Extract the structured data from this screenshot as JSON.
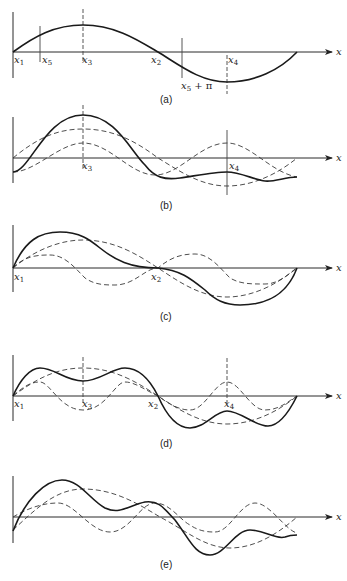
{
  "figure": {
    "axis_label": "x",
    "panels": [
      {
        "id": "a",
        "caption": "(a)",
        "markers": [
          "x1",
          "x5",
          "x3",
          "x2",
          "x5 + π",
          "x4"
        ],
        "description": "single sine wave over one period with marked points"
      },
      {
        "id": "b",
        "caption": "(b)",
        "markers": [
          "x3",
          "x4"
        ],
        "description": "solid composite curve with two dashed component waves, shifted phase"
      },
      {
        "id": "c",
        "caption": "(c)",
        "markers": [
          "x1",
          "x2"
        ],
        "description": "solid composite curve (odd about x2) with two dashed components"
      },
      {
        "id": "d",
        "caption": "(d)",
        "markers": [
          "x1",
          "x3",
          "x2",
          "x4"
        ],
        "description": "solid composite with fundamental and third-harmonic dashed components"
      },
      {
        "id": "e",
        "caption": "(e)",
        "markers": [],
        "description": "solid composite with two dashed components, general phase"
      }
    ],
    "labels": {
      "x1": "x",
      "x1_sub": "1",
      "x2": "x",
      "x2_sub": "2",
      "x3": "x",
      "x3_sub": "3",
      "x4": "x",
      "x4_sub": "4",
      "x5": "x",
      "x5_sub": "5",
      "x5pi_tail": " + π"
    }
  }
}
